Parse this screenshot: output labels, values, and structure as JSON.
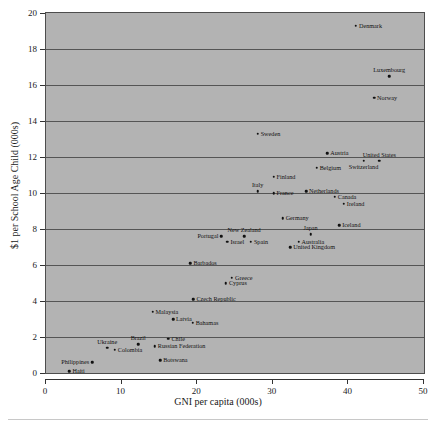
{
  "chart_data": {
    "type": "scatter",
    "title": "",
    "xlabel": "GNI per capita (000s)",
    "ylabel": "$1 per School Age Child (000s)",
    "xlim": [
      0,
      50
    ],
    "ylim": [
      0,
      20
    ],
    "xticks": [
      0,
      10,
      20,
      30,
      40,
      50
    ],
    "yticks": [
      0,
      2,
      4,
      6,
      8,
      10,
      12,
      14,
      16,
      18,
      20
    ],
    "grid": "horizontal",
    "legend": "none",
    "plot_background": "#b3b3b3",
    "point_color": "#111111",
    "points": [
      {
        "label": "Denmark",
        "x": 41.0,
        "y": 19.3,
        "lab": "right"
      },
      {
        "label": "Luxembourg",
        "x": 45.4,
        "y": 16.5,
        "lab": "above"
      },
      {
        "label": "Norway",
        "x": 43.4,
        "y": 15.3,
        "lab": "right"
      },
      {
        "label": "Sweden",
        "x": 28.0,
        "y": 13.3,
        "lab": "right"
      },
      {
        "label": "Austria",
        "x": 37.2,
        "y": 12.2,
        "lab": "right"
      },
      {
        "label": "United States",
        "x": 44.1,
        "y": 11.8,
        "lab": "above"
      },
      {
        "label": "Switzerland",
        "x": 42.0,
        "y": 11.8,
        "lab": "below"
      },
      {
        "label": "Belgium",
        "x": 35.8,
        "y": 11.4,
        "lab": "right"
      },
      {
        "label": "Finland",
        "x": 30.1,
        "y": 10.9,
        "lab": "right"
      },
      {
        "label": "Italy",
        "x": 28.0,
        "y": 10.1,
        "lab": "above"
      },
      {
        "label": "France",
        "x": 30.1,
        "y": 10.0,
        "lab": "right"
      },
      {
        "label": "Netherlands",
        "x": 34.4,
        "y": 10.1,
        "lab": "right"
      },
      {
        "label": "Canada",
        "x": 38.2,
        "y": 9.8,
        "lab": "right"
      },
      {
        "label": "Ireland",
        "x": 39.4,
        "y": 9.4,
        "lab": "right"
      },
      {
        "label": "Germany",
        "x": 31.3,
        "y": 8.6,
        "lab": "right"
      },
      {
        "label": "Iceland",
        "x": 38.8,
        "y": 8.2,
        "lab": "right"
      },
      {
        "label": "Japan",
        "x": 35.0,
        "y": 7.7,
        "lab": "above"
      },
      {
        "label": "Portugal",
        "x": 23.2,
        "y": 7.6,
        "lab": "left"
      },
      {
        "label": "New Zealand",
        "x": 26.2,
        "y": 7.6,
        "lab": "above"
      },
      {
        "label": "Israel",
        "x": 24.0,
        "y": 7.3,
        "lab": "right"
      },
      {
        "label": "Spain",
        "x": 27.1,
        "y": 7.3,
        "lab": "right"
      },
      {
        "label": "Australia",
        "x": 33.4,
        "y": 7.3,
        "lab": "right"
      },
      {
        "label": "United Kingdom",
        "x": 32.3,
        "y": 7.0,
        "lab": "right"
      },
      {
        "label": "Barbados",
        "x": 19.1,
        "y": 6.1,
        "lab": "right"
      },
      {
        "label": "Greece",
        "x": 24.6,
        "y": 5.3,
        "lab": "right"
      },
      {
        "label": "Cyprus",
        "x": 23.8,
        "y": 5.0,
        "lab": "right"
      },
      {
        "label": "Czech Republic",
        "x": 19.5,
        "y": 4.1,
        "lab": "right"
      },
      {
        "label": "Malaysia",
        "x": 14.1,
        "y": 3.4,
        "lab": "right"
      },
      {
        "label": "Latvia",
        "x": 16.8,
        "y": 3.0,
        "lab": "right"
      },
      {
        "label": "Bahamas",
        "x": 19.4,
        "y": 2.8,
        "lab": "right"
      },
      {
        "label": "Chile",
        "x": 16.2,
        "y": 1.9,
        "lab": "right"
      },
      {
        "label": "Brazil",
        "x": 12.2,
        "y": 1.6,
        "lab": "above"
      },
      {
        "label": "Russian Federation",
        "x": 14.4,
        "y": 1.5,
        "lab": "right"
      },
      {
        "label": "Ukraine",
        "x": 8.1,
        "y": 1.4,
        "lab": "above"
      },
      {
        "label": "Colombia",
        "x": 9.1,
        "y": 1.3,
        "lab": "right"
      },
      {
        "label": "Philippines",
        "x": 6.1,
        "y": 0.6,
        "lab": "left"
      },
      {
        "label": "Botswana",
        "x": 15.1,
        "y": 0.7,
        "lab": "right"
      },
      {
        "label": "Haiti",
        "x": 3.1,
        "y": 0.1,
        "lab": "right"
      }
    ]
  }
}
